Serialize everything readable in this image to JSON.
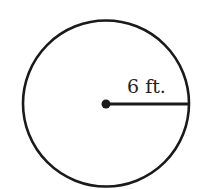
{
  "diagram": {
    "shape": "circle",
    "radius_label": "6 ft.",
    "stroke_color": "#1a1a1a",
    "background": "#ffffff"
  }
}
